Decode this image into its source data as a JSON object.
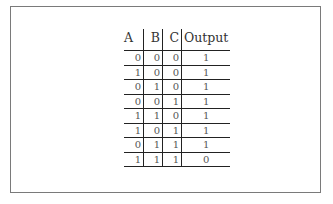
{
  "table": {
    "headers": [
      "A",
      "B",
      "C",
      "Output"
    ],
    "rows": [
      [
        "0",
        "0",
        "0",
        "1"
      ],
      [
        "1",
        "0",
        "0",
        "1"
      ],
      [
        "0",
        "1",
        "0",
        "1"
      ],
      [
        "0",
        "0",
        "1",
        "1"
      ],
      [
        "1",
        "1",
        "0",
        "1"
      ],
      [
        "1",
        "0",
        "1",
        "1"
      ],
      [
        "0",
        "1",
        "1",
        "1"
      ],
      [
        "1",
        "1",
        "1",
        "0"
      ]
    ]
  }
}
